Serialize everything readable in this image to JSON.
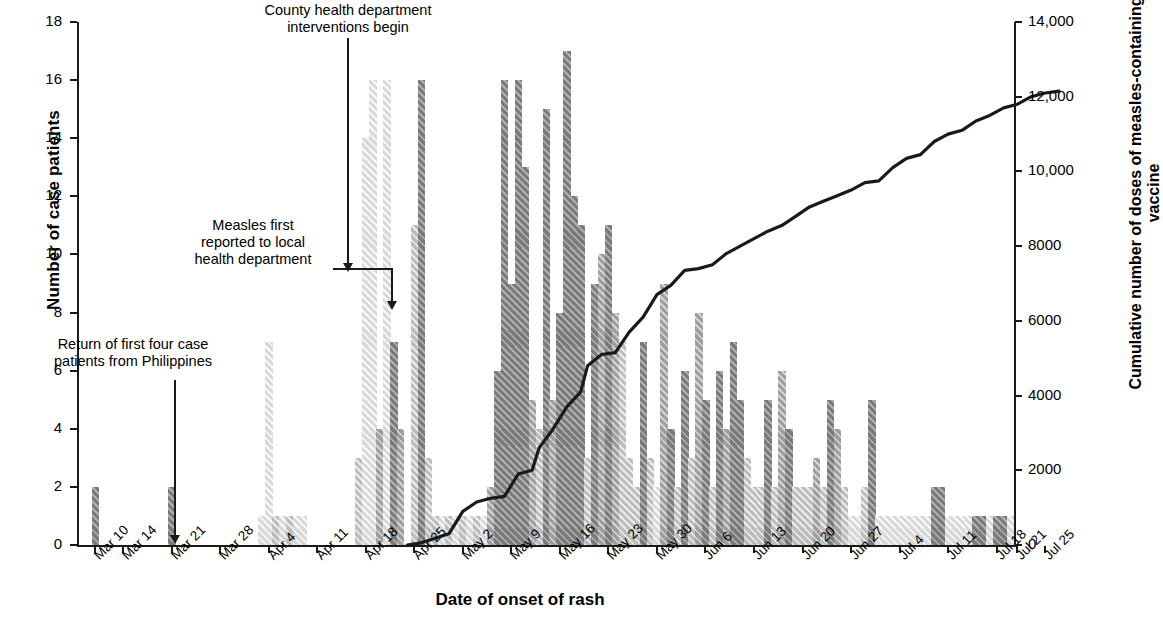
{
  "chart_data": {
    "type": "bar",
    "title": "",
    "xlabel": "Date of onset of rash",
    "ylabel": "Number of case patients",
    "y2label": "Cumulative number of doses of measles-containing vaccine",
    "ylim": [
      0,
      18
    ],
    "yticks": [
      0,
      2,
      4,
      6,
      8,
      10,
      12,
      14,
      16,
      18
    ],
    "ytick_labels": [
      "0",
      "2",
      "4",
      "6",
      "8",
      "10",
      "12",
      "14",
      "16",
      "18"
    ],
    "y2lim": [
      0,
      14000
    ],
    "y2ticks": [
      0,
      2000,
      4000,
      6000,
      8000,
      10000,
      12000,
      14000
    ],
    "y2tick_labels": [
      "0",
      "2000",
      "4000",
      "6000",
      "8000",
      "10,000",
      "12,000",
      "14,000"
    ],
    "grid": false,
    "legend": "none",
    "x_start": "Mar 8",
    "x_end": "Jul 26",
    "xtick_labels": [
      "Mar 10",
      "Mar 14",
      "Mar 21",
      "Mar 28",
      "Apr 4",
      "Apr 11",
      "Apr 18",
      "Apr 25",
      "May 2",
      "May 9",
      "May 16",
      "May 23",
      "May 30",
      "Jun 6",
      "Jun 13",
      "Jun 20",
      "Jun 27",
      "Jul 4",
      "Jul 11",
      "Jul 18",
      "Jul 21",
      "Jul 25"
    ],
    "xtick_days": [
      2,
      6,
      13,
      20,
      27,
      34,
      41,
      48,
      55,
      62,
      69,
      76,
      83,
      90,
      97,
      104,
      111,
      118,
      125,
      132,
      135,
      139
    ],
    "bar_values": [
      0,
      0,
      2,
      0,
      0,
      0,
      0,
      0,
      0,
      0,
      0,
      0,
      0,
      2,
      0,
      0,
      0,
      0,
      0,
      0,
      0,
      0,
      0,
      0,
      0,
      0,
      1,
      7,
      1,
      1,
      1,
      1,
      1,
      0,
      0,
      0,
      0,
      0,
      0,
      0,
      3,
      14,
      16,
      4,
      16,
      7,
      4,
      0,
      11,
      16,
      3,
      1,
      1,
      1,
      1,
      1,
      1,
      1,
      1,
      2,
      6,
      16,
      9,
      16,
      13,
      5,
      4,
      15,
      5,
      8,
      17,
      12,
      11,
      3,
      9,
      10,
      11,
      8,
      7,
      3,
      2,
      7,
      3,
      2,
      9,
      4,
      2,
      6,
      3,
      8,
      5,
      2,
      6,
      4,
      7,
      5,
      3,
      2,
      2,
      5,
      2,
      6,
      4,
      2,
      2,
      2,
      3,
      2,
      5,
      4,
      2,
      1,
      1,
      2,
      5,
      1,
      1,
      1,
      1,
      1,
      1,
      1,
      1,
      2,
      2,
      1,
      1,
      1,
      1,
      1,
      1,
      1,
      1,
      1,
      1
    ],
    "bar_shade_index": [
      0,
      0,
      3,
      0,
      0,
      0,
      0,
      0,
      0,
      0,
      0,
      0,
      0,
      3,
      0,
      0,
      0,
      0,
      0,
      0,
      0,
      0,
      0,
      0,
      0,
      0,
      0,
      0,
      1,
      0,
      1,
      0,
      0,
      0,
      0,
      0,
      0,
      0,
      0,
      0,
      1,
      0,
      0,
      2,
      0,
      3,
      2,
      0,
      1,
      3,
      1,
      1,
      0,
      1,
      0,
      1,
      0,
      1,
      0,
      2,
      3,
      3,
      3,
      3,
      3,
      2,
      1,
      3,
      2,
      3,
      3,
      3,
      3,
      1,
      3,
      2,
      3,
      2,
      1,
      1,
      1,
      3,
      1,
      0,
      2,
      3,
      1,
      3,
      1,
      2,
      3,
      1,
      3,
      2,
      3,
      3,
      1,
      1,
      1,
      3,
      1,
      2,
      3,
      1,
      1,
      1,
      2,
      1,
      3,
      2,
      1,
      0,
      0,
      1,
      3,
      0,
      0,
      0,
      0,
      0,
      0,
      0,
      0,
      3,
      3,
      0,
      0,
      0,
      0,
      3,
      3,
      0,
      3,
      3,
      0
    ],
    "line_name": "Cumulative doses of measles-containing vaccine",
    "line_color": "#1a1a1a",
    "line_points": [
      [
        47,
        0
      ],
      [
        49,
        60
      ],
      [
        51,
        180
      ],
      [
        53,
        300
      ],
      [
        55,
        900
      ],
      [
        57,
        1150
      ],
      [
        59,
        1250
      ],
      [
        61,
        1300
      ],
      [
        63,
        1900
      ],
      [
        65,
        2000
      ],
      [
        66,
        2600
      ],
      [
        68,
        3100
      ],
      [
        70,
        3700
      ],
      [
        72,
        4100
      ],
      [
        73,
        4800
      ],
      [
        75,
        5100
      ],
      [
        77,
        5150
      ],
      [
        79,
        5700
      ],
      [
        81,
        6100
      ],
      [
        83,
        6700
      ],
      [
        85,
        6950
      ],
      [
        87,
        7350
      ],
      [
        89,
        7400
      ],
      [
        91,
        7500
      ],
      [
        93,
        7800
      ],
      [
        95,
        8000
      ],
      [
        97,
        8200
      ],
      [
        99,
        8400
      ],
      [
        101,
        8550
      ],
      [
        103,
        8800
      ],
      [
        105,
        9050
      ],
      [
        107,
        9200
      ],
      [
        109,
        9350
      ],
      [
        111,
        9500
      ],
      [
        113,
        9700
      ],
      [
        115,
        9750
      ],
      [
        117,
        10100
      ],
      [
        119,
        10350
      ],
      [
        121,
        10450
      ],
      [
        123,
        10800
      ],
      [
        125,
        11000
      ],
      [
        127,
        11100
      ],
      [
        129,
        11350
      ],
      [
        131,
        11500
      ],
      [
        133,
        11700
      ],
      [
        135,
        11800
      ],
      [
        137,
        12000
      ],
      [
        139,
        12100
      ],
      [
        141,
        12150
      ]
    ]
  },
  "annotations": [
    {
      "id": "return-philippines",
      "text": "Return of first four case\npatients from Philippines"
    },
    {
      "id": "measles-reported",
      "text": "Measles first\nreported to local\nhealth department"
    },
    {
      "id": "interventions-begin",
      "text": "County health department\ninterventions begin"
    }
  ]
}
